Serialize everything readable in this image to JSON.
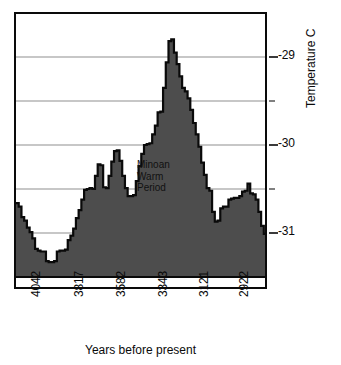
{
  "chart_data": {
    "type": "area",
    "title": "",
    "xlabel": "Years before present",
    "ylabel": "Temperature C",
    "x_axis_inverted": true,
    "xtick_labels": [
      "4042",
      "3817",
      "3582",
      "3343",
      "3121",
      "2922"
    ],
    "xtick_positions": [
      4042,
      3817,
      3582,
      3343,
      3121,
      2922
    ],
    "ytick_labels": [
      "-29",
      "-30",
      "-31"
    ],
    "ytick_values": [
      -29,
      -30,
      -31
    ],
    "ylim": [
      -31.55,
      -28.65
    ],
    "xlim": [
      4100,
      2820
    ],
    "grid": "horizontal-major-and-minor",
    "gridline_values": [
      -29,
      -29.5,
      -30,
      -30.5,
      -31
    ],
    "fill_color": "#4d4d4d",
    "line_color": "#0a0a0a",
    "annotations": [
      {
        "text": "Minoan\nWarm\nPeriod",
        "x": 3290,
        "y": -30.45
      }
    ],
    "series": [
      {
        "name": "Temperature",
        "step": "post",
        "x": [
          4100,
          4086,
          4072,
          4058,
          4044,
          4030,
          4016,
          4002,
          3988,
          3974,
          3960,
          3946,
          3932,
          3918,
          3904,
          3890,
          3876,
          3862,
          3848,
          3834,
          3820,
          3806,
          3792,
          3778,
          3764,
          3750,
          3736,
          3722,
          3708,
          3694,
          3680,
          3666,
          3652,
          3638,
          3624,
          3610,
          3596,
          3582,
          3568,
          3554,
          3540,
          3526,
          3512,
          3498,
          3484,
          3470,
          3456,
          3442,
          3428,
          3414,
          3400,
          3386,
          3372,
          3358,
          3344,
          3330,
          3316,
          3302,
          3288,
          3274,
          3260,
          3246,
          3232,
          3218,
          3204,
          3190,
          3176,
          3162,
          3148,
          3134,
          3120,
          3106,
          3092,
          3078,
          3064,
          3050,
          3036,
          3022,
          3008,
          2994,
          2980,
          2966,
          2952,
          2938,
          2924,
          2910,
          2896,
          2882,
          2868,
          2854,
          2840,
          2826
        ],
        "y": [
          -30.66,
          -30.7,
          -30.82,
          -30.86,
          -30.94,
          -30.99,
          -31.06,
          -31.18,
          -31.2,
          -31.21,
          -31.21,
          -31.32,
          -31.33,
          -31.33,
          -31.32,
          -31.21,
          -31.2,
          -31.2,
          -31.19,
          -31.08,
          -31.03,
          -30.95,
          -30.83,
          -30.74,
          -30.62,
          -30.51,
          -30.5,
          -30.49,
          -30.5,
          -30.35,
          -30.22,
          -30.23,
          -30.48,
          -30.49,
          -30.35,
          -30.19,
          -30.07,
          -30.06,
          -30.18,
          -30.35,
          -30.49,
          -30.58,
          -30.58,
          -30.57,
          -30.41,
          -30.24,
          -30.1,
          -30.0,
          -29.99,
          -29.98,
          -29.88,
          -29.78,
          -29.63,
          -29.62,
          -29.35,
          -29.06,
          -28.82,
          -28.8,
          -28.95,
          -29.08,
          -29.22,
          -29.35,
          -29.39,
          -29.47,
          -29.6,
          -29.75,
          -29.88,
          -30.02,
          -30.2,
          -30.34,
          -30.49,
          -30.52,
          -30.76,
          -30.87,
          -30.86,
          -30.72,
          -30.7,
          -30.7,
          -30.62,
          -30.61,
          -30.6,
          -30.6,
          -30.58,
          -30.53,
          -30.52,
          -30.44,
          -30.55,
          -30.56,
          -30.62,
          -30.76,
          -30.92,
          -31.01
        ]
      }
    ]
  },
  "axes": {
    "y_title": "Temperature C",
    "x_title": "Years before present",
    "y_ticks": [
      "-29",
      "-30",
      "-31"
    ],
    "x_ticks": [
      "4042",
      "3817",
      "3582",
      "3343",
      "3121",
      "2922"
    ]
  },
  "annotation": {
    "minoan_warm_period": "Minoan\nWarm\nPeriod"
  }
}
